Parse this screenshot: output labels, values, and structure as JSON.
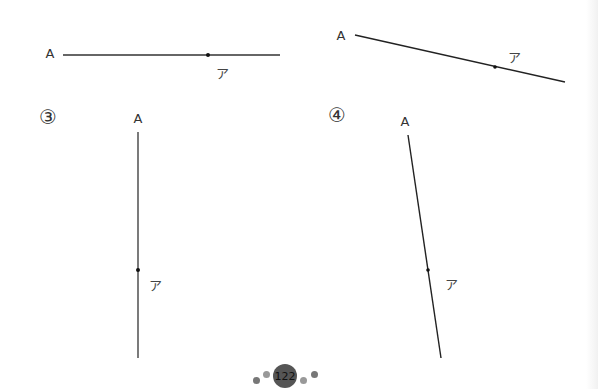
{
  "figures": [
    {
      "id": "1",
      "number_label": "",
      "start_label": "A",
      "point_label": "ア"
    },
    {
      "id": "2",
      "number_label": "",
      "start_label": "A",
      "point_label": "ア"
    },
    {
      "id": "3",
      "number_label": "③",
      "start_label": "A",
      "point_label": "ア"
    },
    {
      "id": "4",
      "number_label": "④",
      "start_label": "A",
      "point_label": "ア"
    }
  ],
  "footer": {
    "page_number": "122"
  },
  "colors": {
    "line": "#222222",
    "badge": "#555555",
    "footer_dot": "#8a8a8a"
  }
}
